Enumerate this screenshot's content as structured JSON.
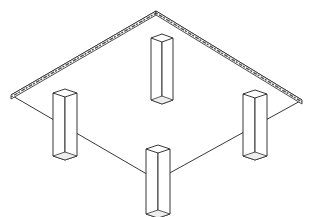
{
  "diagram": {
    "colors": {
      "line": "#222222",
      "background": "#ffffff",
      "slab_edge_texture": "#555555"
    },
    "slab": {
      "top": [
        156,
        11
      ],
      "right": [
        302,
        100
      ],
      "front": [
        157,
        180
      ],
      "left": [
        11,
        95
      ],
      "thickness": 4
    },
    "columns": [
      {
        "name": "back",
        "top": [
          162,
          34
        ],
        "half_width": 11,
        "height": 62
      },
      {
        "name": "left",
        "top": [
          65,
          89
        ],
        "half_width": 12,
        "height": 63
      },
      {
        "name": "right",
        "top": [
          255,
          90
        ],
        "half_width": 12,
        "height": 62
      },
      {
        "name": "front",
        "top": [
          158,
          145
        ],
        "half_width": 12,
        "height": 65
      }
    ]
  }
}
